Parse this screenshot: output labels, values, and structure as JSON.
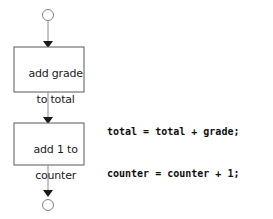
{
  "diagram": {
    "type": "flowchart",
    "title": "",
    "colors": {
      "stroke": "#6e6e6e",
      "box_stroke": "#595959",
      "arrowhead": "#1a1a1a",
      "text": "#1a1a1a",
      "code_text": "#101010",
      "background": "#ffffff"
    },
    "nodes": [
      {
        "id": "start-terminator",
        "shape": "circle",
        "label": "",
        "cx": 48,
        "cy": 15,
        "r": 5.5
      },
      {
        "id": "process-add-grade",
        "shape": "rectangle",
        "label_line_1": "add grade",
        "label_line_2": "to total",
        "x": 14,
        "y": 47,
        "width": 70,
        "height": 45
      },
      {
        "id": "process-add-counter",
        "shape": "rectangle",
        "label_line_1": "add 1 to",
        "label_line_2": "counter",
        "x": 14,
        "y": 123,
        "width": 70,
        "height": 42
      },
      {
        "id": "end-terminator",
        "shape": "circle",
        "label": "",
        "cx": 48,
        "cy": 205,
        "r": 5.5
      }
    ],
    "connectors": [
      {
        "id": "start-to-add-grade",
        "from": "start-terminator",
        "to": "process-add-grade",
        "arrow": "down"
      },
      {
        "id": "add-grade-to-add-counter",
        "from": "process-add-grade",
        "to": "process-add-counter",
        "arrow": "down"
      },
      {
        "id": "add-counter-to-end",
        "from": "process-add-counter",
        "to": "end-terminator",
        "arrow": "down"
      }
    ]
  },
  "code_annotation": {
    "lines": [
      "total = total + grade;",
      "counter = counter + 1;"
    ],
    "line_1": "total = total + grade;",
    "line_2": "counter = counter + 1;"
  }
}
